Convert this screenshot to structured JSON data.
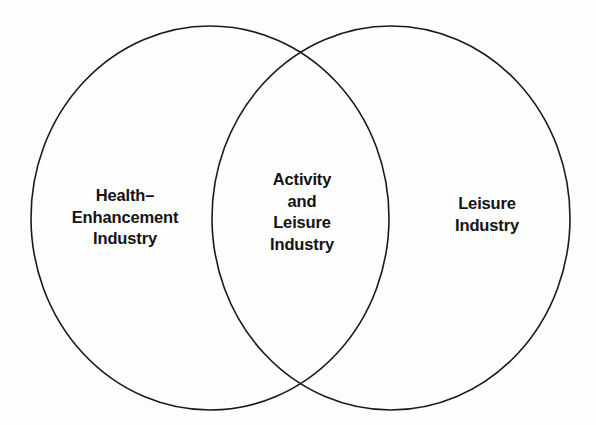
{
  "diagram": {
    "type": "venn",
    "title": "",
    "background_color": "#fdfdfd",
    "stroke_color": "#1a1a1a",
    "text_color": "#141414",
    "sets": [
      {
        "id": "left",
        "region": "left-only",
        "label": "Health–\nEnhancement\nIndustry",
        "label_lines": [
          "Health–",
          "Enhancement",
          "Industry"
        ],
        "center_x": 210,
        "center_y": 218,
        "radius_x": 179,
        "radius_y": 192
      },
      {
        "id": "right",
        "region": "right-only",
        "label": "Leisure\nIndustry",
        "label_lines": [
          "Leisure",
          "Industry"
        ],
        "center_x": 391,
        "center_y": 218,
        "radius_x": 179,
        "radius_y": 192
      }
    ],
    "intersection": {
      "id": "center",
      "region": "overlap",
      "label": "Activity\nand\nLeisure\nIndustry",
      "label_lines": [
        "Activity",
        "and",
        "Leisure",
        "Industry"
      ],
      "top_point_x": 300,
      "top_point_y": 60,
      "bottom_point_x": 301,
      "bottom_point_y": 383
    }
  }
}
